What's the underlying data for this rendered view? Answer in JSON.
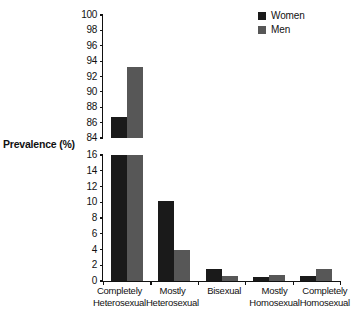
{
  "chart_data": {
    "type": "bar",
    "title": "",
    "xlabel": "",
    "ylabel": "Prevalence (%)",
    "grid": false,
    "legend_position": "top-right",
    "broken_axis": true,
    "axis_note": "y-axis is broken between 16 and 84",
    "categories": [
      "Completely Heterosexual",
      "Mostly Heterosexual",
      "Bisexual",
      "Mostly Homosexual",
      "Completely Homosexual"
    ],
    "category_lines": [
      [
        "Completely",
        "Heterosexual"
      ],
      [
        "Mostly",
        "Heterosexual"
      ],
      [
        "Bisexual",
        ""
      ],
      [
        "Mostly",
        "Homosexual"
      ],
      [
        "Completely",
        "Homosexual"
      ]
    ],
    "series": [
      {
        "name": "Women",
        "color": "#1a1a1a",
        "values": [
          86.7,
          10.1,
          1.5,
          0.5,
          0.6
        ]
      },
      {
        "name": "Men",
        "color": "#575757",
        "values": [
          93.3,
          3.9,
          0.6,
          0.8,
          1.5
        ]
      }
    ],
    "panels": [
      {
        "name": "upper",
        "ylim": [
          84,
          100
        ],
        "ticks": [
          84,
          86,
          88,
          90,
          92,
          94,
          96,
          98,
          100
        ]
      },
      {
        "name": "lower",
        "ylim": [
          0,
          16
        ],
        "ticks": [
          0,
          2,
          4,
          6,
          8,
          10,
          12,
          14,
          16
        ]
      }
    ]
  },
  "legend": {
    "entries": [
      {
        "label": "Women",
        "color": "#1a1a1a"
      },
      {
        "label": "Men",
        "color": "#575757"
      }
    ]
  },
  "axis": {
    "y_title": "Prevalence (%)"
  }
}
